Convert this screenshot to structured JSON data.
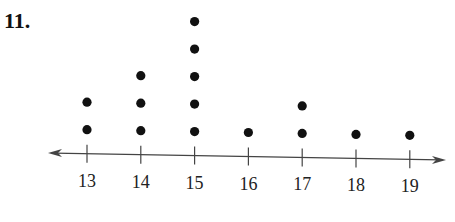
{
  "problem_number": "11.",
  "chart_data": {
    "type": "dot-plot",
    "title": "",
    "xlabel": "",
    "ylabel": "",
    "categories": [
      "13",
      "14",
      "15",
      "16",
      "17",
      "18",
      "19"
    ],
    "values": [
      2,
      3,
      5,
      1,
      2,
      1,
      1
    ],
    "axis_range": [
      13,
      19
    ],
    "grid": false,
    "legend": null,
    "dot_color": "#111111",
    "axis_color": "#444444"
  }
}
